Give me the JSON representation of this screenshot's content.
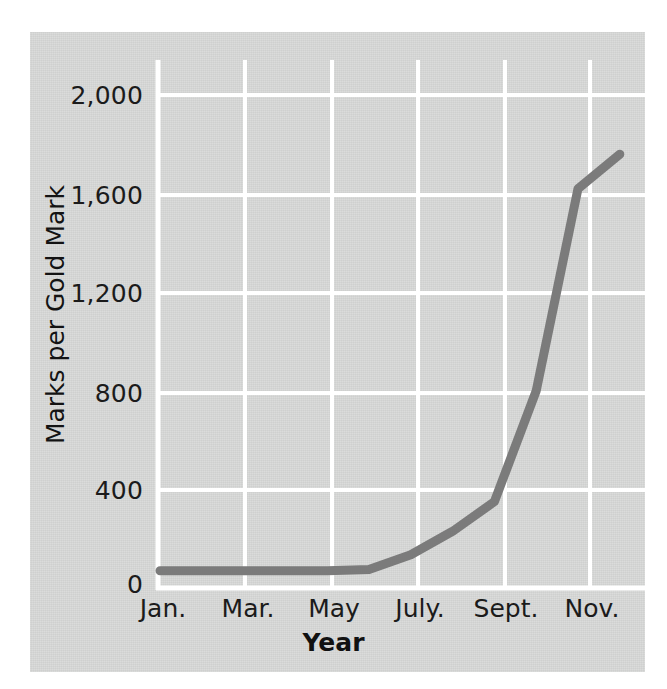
{
  "chart_data": {
    "type": "line",
    "title": "",
    "xlabel": "Year",
    "ylabel": "Marks per Gold Mark",
    "x_tick_labels": [
      "Jan.",
      "Mar.",
      "May",
      "July.",
      "Sept.",
      "Nov."
    ],
    "y_tick_labels": [
      "0",
      "400",
      "800",
      "1,200",
      "1,600",
      "2,000"
    ],
    "y_ticks": [
      0,
      400,
      800,
      1200,
      1600,
      2000
    ],
    "ylim": [
      0,
      2100
    ],
    "xlim": [
      "Jan.",
      "Dec."
    ],
    "grid": true,
    "grid_color": "#ffffff",
    "legend": "none",
    "line_color": "#7b7b7b",
    "background_color": "#d7d8d7",
    "series": [
      {
        "name": "Marks per Gold Mark",
        "months": [
          "Jan.",
          "Feb.",
          "Mar.",
          "Apr.",
          "May",
          "June",
          "July.",
          "Aug.",
          "Sept.",
          "Oct.",
          "Nov.",
          "Dec."
        ],
        "values": [
          70,
          70,
          70,
          70,
          70,
          75,
          135,
          230,
          350,
          800,
          1620,
          1760
        ]
      }
    ]
  },
  "axis": {
    "y_title": "Marks per Gold Mark",
    "x_title": "Year",
    "y_labels": {
      "t0": "0",
      "t400": "400",
      "t800": "800",
      "t1200": "1,200",
      "t1600": "1,600",
      "t2000": "2,000"
    },
    "x_labels": {
      "jan": "Jan.",
      "mar": "Mar.",
      "may": "May",
      "july": "July.",
      "sept": "Sept.",
      "nov": "Nov."
    }
  }
}
